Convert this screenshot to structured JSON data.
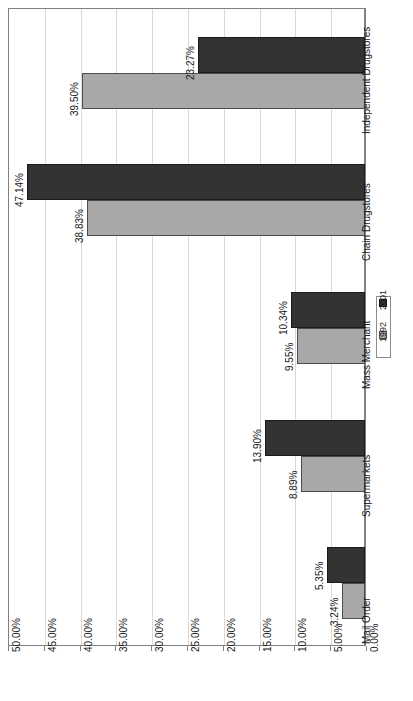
{
  "chart_data": {
    "type": "bar",
    "orientation": "horizontal",
    "title": "",
    "xlabel": "",
    "ylabel": "",
    "categories": [
      "Mail Order",
      "Supermarkets",
      "Mass Merchant",
      "Chain Drugstores",
      "Independent Drugstores"
    ],
    "series": [
      {
        "name": "1992",
        "color": "#a8a8a8",
        "values": [
          3.24,
          8.89,
          9.55,
          38.83,
          39.5
        ],
        "labels": [
          "3.24%",
          "8.89%",
          "9.55%",
          "38.83%",
          "39.50%"
        ]
      },
      {
        "name": "2001",
        "color": "#333333",
        "values": [
          5.35,
          13.9,
          10.34,
          47.14,
          23.27
        ],
        "labels": [
          "5.35%",
          "13.90%",
          "10.34%",
          "47.14%",
          "23.27%"
        ]
      }
    ],
    "xlim": [
      0,
      50
    ],
    "tick_values": [
      50,
      45,
      40,
      35,
      30,
      25,
      20,
      15,
      10,
      5,
      0
    ],
    "tick_labels": [
      "50.00%",
      "45.00%",
      "40.00%",
      "35.00%",
      "30.00%",
      "25.00%",
      "20.00%",
      "15.00%",
      "10.00%",
      "5.00%",
      "0.00%"
    ],
    "grid": true,
    "legend_position": "right",
    "legend_entries": [
      "2001",
      "1992"
    ],
    "axis_direction": "value axis increases right-to-left; category axis top-to-bottom"
  },
  "colors": {
    "series_1992": "#a8a8a8",
    "series_2001": "#333333",
    "gridline": "#d9d9d9",
    "axis": "#808080",
    "background": "#ffffff",
    "text": "#1a1a1a"
  }
}
